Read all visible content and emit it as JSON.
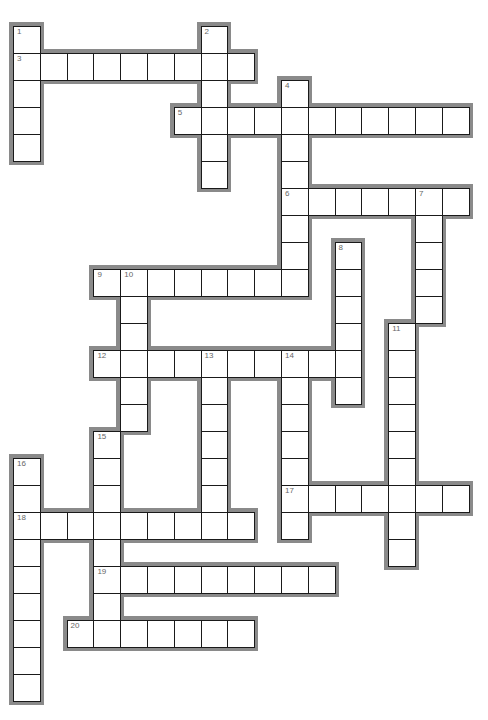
{
  "puzzle": {
    "type": "crossword",
    "layout": {
      "origin_x": 13,
      "origin_y": 26,
      "cell_w": 26.8,
      "cell_h": 27
    },
    "colors": {
      "outline": "#8a8a8a",
      "cell_border": "#1a1a1a",
      "cell_fill": "#ffffff",
      "number": "#666666"
    },
    "words": [
      {
        "number": "1",
        "direction": "down",
        "row": 0,
        "col": 0,
        "length": 5
      },
      {
        "number": "2",
        "direction": "down",
        "row": 0,
        "col": 7,
        "length": 6
      },
      {
        "number": "3",
        "direction": "across",
        "row": 1,
        "col": 0,
        "length": 9
      },
      {
        "number": "4",
        "direction": "down",
        "row": 2,
        "col": 10,
        "length": 8
      },
      {
        "number": "5",
        "direction": "across",
        "row": 3,
        "col": 6,
        "length": 11
      },
      {
        "number": "6",
        "direction": "across",
        "row": 6,
        "col": 10,
        "length": 7
      },
      {
        "number": "7",
        "direction": "down",
        "row": 6,
        "col": 15,
        "length": 5
      },
      {
        "number": "8",
        "direction": "down",
        "row": 8,
        "col": 12,
        "length": 6
      },
      {
        "number": "9",
        "direction": "across",
        "row": 9,
        "col": 3,
        "length": 8
      },
      {
        "number": "10",
        "direction": "down",
        "row": 9,
        "col": 4,
        "length": 6
      },
      {
        "number": "11",
        "direction": "down",
        "row": 11,
        "col": 14,
        "length": 9
      },
      {
        "number": "12",
        "direction": "across",
        "row": 12,
        "col": 3,
        "length": 10
      },
      {
        "number": "13",
        "direction": "down",
        "row": 12,
        "col": 7,
        "length": 7
      },
      {
        "number": "14",
        "direction": "down",
        "row": 12,
        "col": 10,
        "length": 7
      },
      {
        "number": "15",
        "direction": "down",
        "row": 15,
        "col": 3,
        "length": 8
      },
      {
        "number": "16",
        "direction": "down",
        "row": 16,
        "col": 0,
        "length": 9
      },
      {
        "number": "17",
        "direction": "across",
        "row": 17,
        "col": 10,
        "length": 7
      },
      {
        "number": "18",
        "direction": "across",
        "row": 18,
        "col": 0,
        "length": 9
      },
      {
        "number": "19",
        "direction": "across",
        "row": 20,
        "col": 3,
        "length": 9
      },
      {
        "number": "20",
        "direction": "across",
        "row": 22,
        "col": 2,
        "length": 7
      }
    ]
  }
}
